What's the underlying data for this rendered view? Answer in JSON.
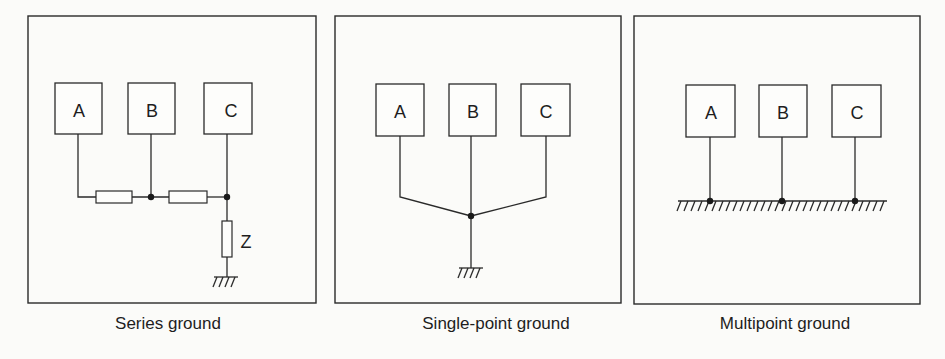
{
  "figure": {
    "panels": [
      {
        "id": "series",
        "caption": "Series ground",
        "units": [
          "A",
          "B",
          "C"
        ],
        "impedance_label": "Z"
      },
      {
        "id": "single-point",
        "caption": "Single-point ground",
        "units": [
          "A",
          "B",
          "C"
        ]
      },
      {
        "id": "multipoint",
        "caption": "Multipoint ground",
        "units": [
          "A",
          "B",
          "C"
        ]
      }
    ],
    "colors": {
      "line": "#2a2a2a",
      "background": "#fbfbf9"
    }
  }
}
